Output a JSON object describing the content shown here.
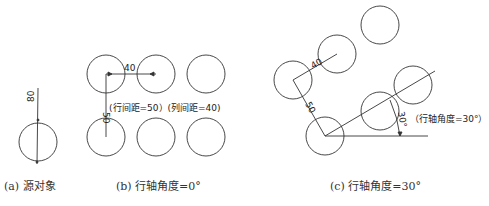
{
  "panels": [
    {
      "id": "a",
      "caption": "(a) 源对象",
      "dimension_label": "80"
    },
    {
      "id": "b",
      "caption": "(b) 行轴角度=0°",
      "row_spacing_dim": "50",
      "col_spacing_dim": "40",
      "note": "(行间距=50）(列间距=40)"
    },
    {
      "id": "c",
      "caption": "(c) 行轴角度=30°",
      "row_spacing_dim": "50",
      "col_spacing_dim": "40",
      "angle_dim": "30°",
      "note": "（行轴角度=30°）"
    }
  ],
  "colors": {
    "line": "#333333",
    "text": "#333333",
    "background": "#ffffff"
  }
}
